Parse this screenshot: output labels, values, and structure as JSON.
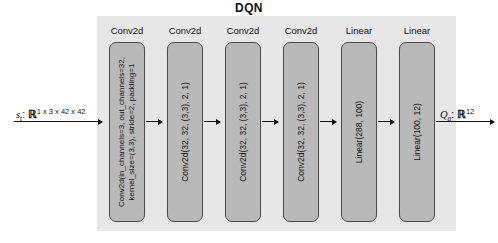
{
  "diagram": {
    "title": "DQN",
    "colors": {
      "panel_background": "#e7e7e7",
      "block_fill": "#b9b9b9",
      "block_border": "#4a4a4a",
      "arrow": "#111111",
      "page_background": "#ffffff"
    }
  },
  "input": {
    "symbol": "s",
    "subscript": "t",
    "separator": ":",
    "space": "ℝ",
    "shape": "1 x 3 x 42 x 42",
    "full_text": "s_t: R^(1 x 3 x 42 x 42)"
  },
  "output": {
    "symbol": "Q",
    "subscript": "a",
    "separator": ":",
    "space": "ℝ",
    "shape": "12",
    "full_text": "Q_a: R^12"
  },
  "layers": [
    {
      "label": "Conv2d",
      "spec": "Conv2d(in_channels=3, out_channels=32,\nkernel_size=(3,3), stride=2, padding=1",
      "lines": 2
    },
    {
      "label": "Conv2d",
      "spec": "Conv2d(32, 32, (3,3), 2, 1)",
      "lines": 1
    },
    {
      "label": "Conv2d",
      "spec": "Conv2d(32, 32, (3,3), 2, 1)",
      "lines": 1
    },
    {
      "label": "Conv2d",
      "spec": "Conv2d(32, 32, (3,3), 2, 1)",
      "lines": 1
    },
    {
      "label": "Linear",
      "spec": "Linear(288, 100)",
      "lines": 1
    },
    {
      "label": "Linear",
      "spec": "Linear(100, 12)",
      "lines": 1
    }
  ]
}
